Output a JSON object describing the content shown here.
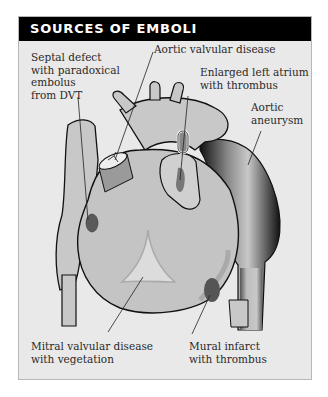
{
  "title": "SOURCES OF EMBOLI",
  "labels": {
    "septal": "Septal defect\nwith paradoxical\nembolus\nfrom DVT",
    "aortic_valvular": "Aortic valvular disease",
    "left_atrium": "Enlarged left atrium\nwith thrombus",
    "aortic_aneurysm": "Aortic\naneurysm",
    "mitral": "Mitral valvular disease\nwith vegetation",
    "mural": "Mural infarct\nwith thrombus"
  },
  "colors": {
    "header_bg": "#000000",
    "panel_bg": "#e9e9e9",
    "heart_fill": "#c4c4c4",
    "outline": "#111111"
  }
}
